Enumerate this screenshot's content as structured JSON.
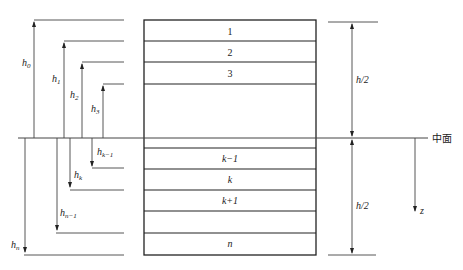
{
  "figure": {
    "layers": [
      {
        "label": "1",
        "italic": false
      },
      {
        "label": "2",
        "italic": false
      },
      {
        "label": "3",
        "italic": false
      },
      {
        "label": "k−1",
        "italic": true
      },
      {
        "label": "k",
        "italic": true
      },
      {
        "label": "k+1",
        "italic": true
      },
      {
        "label": "n",
        "italic": true
      }
    ],
    "heights_up": [
      {
        "base": "h",
        "sub": "0"
      },
      {
        "base": "h",
        "sub": "1"
      },
      {
        "base": "h",
        "sub": "2"
      },
      {
        "base": "h",
        "sub": "3"
      }
    ],
    "heights_down": [
      {
        "base": "h",
        "sub": "k−1"
      },
      {
        "base": "h",
        "sub": "k"
      },
      {
        "base": "h",
        "sub": "n−1"
      },
      {
        "base": "h",
        "sub": "n"
      }
    ],
    "half_thickness_top": "h/2",
    "half_thickness_bottom": "h/2",
    "midplane_label": "中面",
    "axis_label": "z",
    "colors": {
      "line": "#222222",
      "background": "#ffffff"
    }
  }
}
